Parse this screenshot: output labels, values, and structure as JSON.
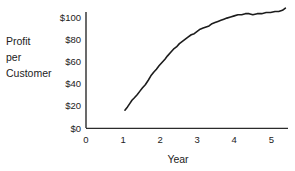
{
  "chart_data": {
    "type": "line",
    "title": "",
    "subtitle": "",
    "xlabel": "Year",
    "ylabel": "Profit per Customer",
    "ylabel_lines": [
      "Profit",
      "per",
      "Customer"
    ],
    "x_tick_labels": [
      "0",
      "1",
      "2",
      "3",
      "4",
      "5"
    ],
    "x_tick_values": [
      0,
      1,
      2,
      3,
      4,
      5
    ],
    "y_tick_labels": [
      "$0",
      "$20",
      "$40",
      "$60",
      "$80",
      "$100"
    ],
    "y_tick_values": [
      0,
      20,
      40,
      60,
      80,
      100
    ],
    "xlim": [
      0,
      5.45
    ],
    "ylim": [
      0,
      115
    ],
    "grid": false,
    "legend": null,
    "line_color": "#1c1c1c",
    "axis_color": "#2b2b2b",
    "series": [
      {
        "name": "Profit per Customer",
        "x": [
          1.05,
          1.12,
          1.18,
          1.24,
          1.3,
          1.38,
          1.45,
          1.52,
          1.6,
          1.68,
          1.75,
          1.82,
          1.9,
          1.97,
          2.05,
          2.13,
          2.2,
          2.28,
          2.36,
          2.44,
          2.52,
          2.6,
          2.68,
          2.76,
          2.84,
          2.92,
          3.0,
          3.08,
          3.16,
          3.24,
          3.32,
          3.4,
          3.48,
          3.56,
          3.64,
          3.72,
          3.8,
          3.9,
          4.0,
          4.1,
          4.2,
          4.3,
          4.4,
          4.5,
          4.62,
          4.74,
          4.86,
          4.98,
          5.1,
          5.2,
          5.3,
          5.38
        ],
        "y": [
          16,
          19,
          22,
          25,
          27,
          30,
          33,
          36,
          39,
          43,
          47,
          50,
          53,
          56,
          59,
          62,
          65,
          68,
          71,
          73,
          76,
          78,
          80,
          82,
          84,
          85,
          87,
          89,
          90,
          91,
          92,
          94,
          95,
          96,
          97,
          98,
          99,
          100,
          101,
          102,
          102,
          103,
          103,
          102,
          103,
          103,
          104,
          104,
          105,
          105,
          106,
          108
        ]
      }
    ]
  }
}
